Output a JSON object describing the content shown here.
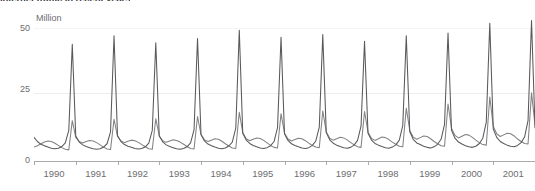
{
  "chart": {
    "title": "Internet traffic in recent years",
    "unit_label": "Million",
    "y_ticks": [
      "0",
      "25",
      "50"
    ],
    "x_ticks": [
      "1990",
      "1991",
      "1992",
      "1993",
      "1994",
      "1995",
      "1996",
      "1997",
      "1998",
      "1999",
      "2000",
      "2001"
    ],
    "series_color_primary": "#58595b",
    "series_color_secondary": "#808285",
    "axis_color": "#a7a9ac",
    "grid_color": "#e6e7e8"
  },
  "chart_data": {
    "type": "line",
    "title": "Internet traffic in recent years",
    "xlabel": "",
    "ylabel": "Million",
    "ylim": [
      0,
      55
    ],
    "xlim": [
      1990,
      2002
    ],
    "grid": true,
    "legend": "none",
    "x_tick_values": [
      1990,
      1991,
      1992,
      1993,
      1994,
      1995,
      1996,
      1997,
      1998,
      1999,
      2000,
      2001
    ],
    "y_tick_values": [
      0,
      25,
      50
    ],
    "x_resolution": "monthly",
    "x": [
      1990.0,
      1990.083,
      1990.167,
      1990.25,
      1990.333,
      1990.417,
      1990.5,
      1990.583,
      1990.667,
      1990.75,
      1990.833,
      1990.917,
      1991.0,
      1991.083,
      1991.167,
      1991.25,
      1991.333,
      1991.417,
      1991.5,
      1991.583,
      1991.667,
      1991.75,
      1991.833,
      1991.917,
      1992.0,
      1992.083,
      1992.167,
      1992.25,
      1992.333,
      1992.417,
      1992.5,
      1992.583,
      1992.667,
      1992.75,
      1992.833,
      1992.917,
      1993.0,
      1993.083,
      1993.167,
      1993.25,
      1993.333,
      1993.417,
      1993.5,
      1993.583,
      1993.667,
      1993.75,
      1993.833,
      1993.917,
      1994.0,
      1994.083,
      1994.167,
      1994.25,
      1994.333,
      1994.417,
      1994.5,
      1994.583,
      1994.667,
      1994.75,
      1994.833,
      1994.917,
      1995.0,
      1995.083,
      1995.167,
      1995.25,
      1995.333,
      1995.417,
      1995.5,
      1995.583,
      1995.667,
      1995.75,
      1995.833,
      1995.917,
      1996.0,
      1996.083,
      1996.167,
      1996.25,
      1996.333,
      1996.417,
      1996.5,
      1996.583,
      1996.667,
      1996.75,
      1996.833,
      1996.917,
      1997.0,
      1997.083,
      1997.167,
      1997.25,
      1997.333,
      1997.417,
      1997.5,
      1997.583,
      1997.667,
      1997.75,
      1997.833,
      1997.917,
      1998.0,
      1998.083,
      1998.167,
      1998.25,
      1998.333,
      1998.417,
      1998.5,
      1998.583,
      1998.667,
      1998.75,
      1998.833,
      1998.917,
      1999.0,
      1999.083,
      1999.167,
      1999.25,
      1999.333,
      1999.417,
      1999.5,
      1999.583,
      1999.667,
      1999.75,
      1999.833,
      1999.917,
      2000.0,
      2000.083,
      2000.167,
      2000.25,
      2000.333,
      2000.417,
      2000.5,
      2000.583,
      2000.667,
      2000.75,
      2000.833,
      2000.917,
      2001.0,
      2001.083,
      2001.167,
      2001.25,
      2001.333,
      2001.417,
      2001.5,
      2001.583,
      2001.667,
      2001.75,
      2001.833,
      2001.917,
      2002.0
    ],
    "series": [
      {
        "name": "Series 1",
        "style": "spiky",
        "values": [
          8.5,
          7.0,
          6.0,
          5.5,
          5.0,
          4.6,
          4.4,
          4.6,
          5.2,
          6.5,
          11.0,
          42.0,
          9.0,
          6.8,
          5.8,
          5.2,
          4.8,
          4.4,
          4.2,
          4.4,
          5.0,
          6.2,
          10.5,
          45.0,
          9.2,
          7.0,
          5.9,
          5.3,
          4.9,
          4.5,
          4.3,
          4.5,
          5.1,
          6.4,
          11.0,
          42.5,
          9.0,
          6.9,
          5.8,
          5.2,
          4.8,
          4.4,
          4.2,
          4.5,
          5.1,
          6.5,
          11.2,
          44.0,
          9.5,
          7.2,
          6.1,
          5.5,
          5.0,
          4.6,
          4.4,
          4.7,
          5.4,
          6.8,
          11.8,
          47.0,
          10.0,
          7.5,
          6.3,
          5.6,
          5.1,
          4.7,
          4.5,
          4.8,
          5.5,
          7.0,
          12.0,
          44.5,
          9.8,
          7.4,
          6.2,
          5.6,
          5.1,
          4.7,
          4.5,
          4.8,
          5.6,
          7.2,
          12.2,
          45.5,
          10.2,
          7.6,
          6.4,
          5.7,
          5.2,
          4.8,
          4.6,
          4.9,
          5.7,
          7.4,
          12.5,
          43.0,
          10.0,
          7.5,
          6.3,
          5.7,
          5.2,
          4.8,
          4.6,
          5.0,
          5.8,
          7.5,
          12.8,
          45.0,
          10.5,
          7.8,
          6.5,
          5.9,
          5.3,
          4.9,
          4.7,
          5.1,
          6.0,
          7.8,
          13.2,
          46.0,
          11.0,
          8.2,
          6.8,
          6.1,
          5.5,
          5.1,
          4.9,
          5.3,
          6.3,
          8.2,
          14.0,
          49.5,
          11.5,
          8.5,
          7.0,
          6.3,
          5.7,
          5.3,
          5.1,
          5.6,
          6.6,
          8.6,
          14.5,
          50.5,
          12.0
        ]
      },
      {
        "name": "Series 2",
        "style": "smooth",
        "values": [
          5.0,
          5.5,
          6.2,
          6.8,
          7.2,
          7.0,
          6.4,
          5.6,
          4.8,
          4.2,
          4.0,
          14.5,
          8.5,
          7.0,
          6.5,
          7.0,
          7.4,
          7.2,
          6.6,
          5.8,
          5.0,
          4.3,
          4.1,
          15.0,
          8.8,
          7.2,
          6.6,
          7.1,
          7.5,
          7.3,
          6.7,
          5.9,
          5.1,
          4.4,
          4.2,
          15.2,
          9.0,
          7.3,
          6.7,
          7.2,
          7.6,
          7.4,
          6.8,
          6.0,
          5.2,
          4.5,
          4.3,
          16.0,
          9.5,
          7.6,
          7.0,
          7.5,
          8.0,
          7.8,
          7.1,
          6.2,
          5.4,
          4.7,
          4.5,
          17.5,
          10.2,
          8.0,
          7.3,
          7.8,
          8.3,
          8.1,
          7.4,
          6.5,
          5.6,
          4.9,
          4.7,
          17.0,
          10.0,
          7.9,
          7.2,
          7.7,
          8.2,
          8.0,
          7.3,
          6.4,
          5.6,
          5.0,
          4.8,
          18.0,
          10.5,
          8.2,
          7.5,
          8.0,
          8.5,
          8.3,
          7.6,
          6.7,
          5.8,
          5.1,
          4.9,
          17.8,
          10.4,
          8.1,
          7.4,
          8.0,
          8.6,
          8.4,
          7.7,
          6.8,
          6.0,
          5.3,
          5.1,
          19.0,
          11.0,
          8.6,
          7.8,
          8.4,
          9.0,
          8.8,
          8.0,
          7.0,
          6.2,
          5.5,
          5.3,
          20.5,
          11.8,
          9.2,
          8.3,
          8.9,
          9.5,
          9.3,
          8.5,
          7.5,
          6.6,
          5.9,
          5.7,
          23.0,
          12.5,
          9.8,
          8.8,
          9.4,
          10.0,
          9.8,
          9.0,
          7.9,
          7.0,
          6.3,
          6.1,
          24.5,
          13.0
        ]
      }
    ]
  }
}
